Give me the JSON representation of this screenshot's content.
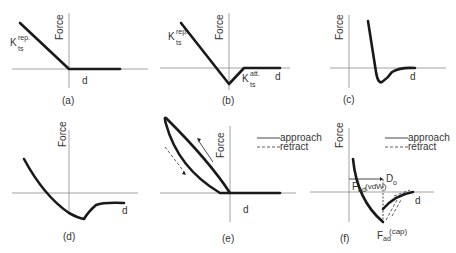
{
  "axis_labels": {
    "y": "Force",
    "x": "d"
  },
  "panels": {
    "a": {
      "caption": "(a)",
      "k_main": "K",
      "k_sup": "rep.",
      "k_sub": "ts"
    },
    "b": {
      "caption": "(b)",
      "k_main": "K",
      "k_sup": "rep.",
      "k_sub": "ts",
      "k2_main": "K",
      "k2_sup": "att.",
      "k2_sub": "ts"
    },
    "c": {
      "caption": "(c)"
    },
    "d": {
      "caption": "(d)"
    },
    "e": {
      "caption": "(e)"
    },
    "f": {
      "caption": "(f)",
      "vdw_main": "F",
      "vdw_sub": "ad",
      "vdw_tail": "(vdW)",
      "d0_main": "D",
      "d0_sub": "o",
      "cap_main": "F",
      "cap_sub": "ad",
      "cap_sup": "(cap)"
    }
  },
  "legend": {
    "approach": "approach",
    "retract": "retract"
  },
  "colors": {
    "curve": "#1a1a1a",
    "axis": "#8a8a8a",
    "text": "#333333"
  }
}
